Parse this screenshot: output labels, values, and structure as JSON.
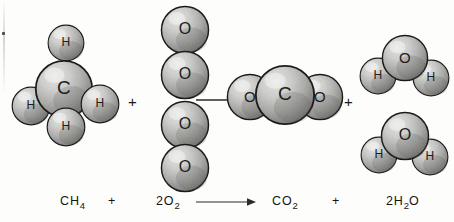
{
  "diagram": {
    "style": "hand-drawn pencil-shaded space-filling molecular models",
    "background_color": "#fdfdfc",
    "outline_color": "#1a1a1a",
    "sphere_light_color": "#e8e8e6",
    "sphere_mid_color": "#a9a9a6",
    "sphere_dark_color": "#5e5e5c",
    "label_color": "#1c1c1c",
    "reactant_operator": "+",
    "product_operator": "+"
  },
  "molecules": [
    {
      "id": "methane",
      "formula": "CH4",
      "name": "methane-molecule",
      "atoms": [
        {
          "element": "H",
          "label": "H",
          "x": 66,
          "y": 43,
          "r": 19,
          "z": 1
        },
        {
          "element": "H",
          "label": "H",
          "x": 31,
          "y": 106,
          "r": 20,
          "z": 1
        },
        {
          "element": "C",
          "label": "C",
          "x": 64,
          "y": 89,
          "r": 30,
          "z": 2
        },
        {
          "element": "H",
          "label": "H",
          "x": 100,
          "y": 104,
          "r": 20,
          "z": 3
        },
        {
          "element": "H",
          "label": "H",
          "x": 66,
          "y": 127,
          "r": 20,
          "z": 4
        }
      ]
    },
    {
      "id": "oxygen-top",
      "formula": "O2",
      "name": "oxygen-molecule-top",
      "atoms": [
        {
          "element": "O",
          "label": "O",
          "x": 185,
          "y": 30,
          "r": 25,
          "z": 1
        },
        {
          "element": "O",
          "label": "O",
          "x": 185,
          "y": 75,
          "r": 25,
          "z": 2
        }
      ]
    },
    {
      "id": "oxygen-bottom",
      "formula": "O2",
      "name": "oxygen-molecule-bottom",
      "atoms": [
        {
          "element": "O",
          "label": "O",
          "x": 185,
          "y": 125,
          "r": 25,
          "z": 1
        },
        {
          "element": "O",
          "label": "O",
          "x": 185,
          "y": 168,
          "r": 25,
          "z": 2
        }
      ]
    },
    {
      "id": "carbon-dioxide",
      "formula": "CO2",
      "name": "carbon-dioxide-molecule",
      "atoms": [
        {
          "element": "O",
          "label": "O",
          "x": 250,
          "y": 97,
          "r": 24,
          "z": 1
        },
        {
          "element": "O",
          "label": "O",
          "x": 320,
          "y": 97,
          "r": 24,
          "z": 1
        },
        {
          "element": "C",
          "label": "C",
          "x": 285,
          "y": 95,
          "r": 31,
          "z": 2
        }
      ]
    },
    {
      "id": "water-top",
      "formula": "H2O",
      "name": "water-molecule-top",
      "atoms": [
        {
          "element": "H",
          "label": "H",
          "x": 378,
          "y": 76,
          "r": 19,
          "z": 1
        },
        {
          "element": "H",
          "label": "H",
          "x": 431,
          "y": 78,
          "r": 19,
          "z": 1
        },
        {
          "element": "O",
          "label": "O",
          "x": 405,
          "y": 58,
          "r": 24,
          "z": 2
        }
      ]
    },
    {
      "id": "water-bottom",
      "formula": "H2O",
      "name": "water-molecule-bottom",
      "atoms": [
        {
          "element": "H",
          "label": "H",
          "x": 379,
          "y": 155,
          "r": 19,
          "z": 1
        },
        {
          "element": "H",
          "label": "H",
          "x": 430,
          "y": 157,
          "r": 19,
          "z": 1
        },
        {
          "element": "O",
          "label": "O",
          "x": 405,
          "y": 136,
          "r": 25,
          "z": 2
        }
      ]
    }
  ],
  "diagram_operators": [
    {
      "symbol": "+",
      "name": "diagram-plus-reactants",
      "x": 128,
      "y": 94
    },
    {
      "symbol": "+",
      "name": "diagram-plus-products",
      "x": 344,
      "y": 94
    }
  ],
  "diagram_arrow": {
    "name": "reaction-arrow-diagram",
    "x": 196,
    "y": 98,
    "length": 42
  },
  "equation": {
    "name": "chemical-equation",
    "full_text": "CH4 + 2O2 -> CO2 + 2H2O",
    "terms": [
      {
        "id": "reactant-methane",
        "coefficient": "",
        "symbol": "CH",
        "subscript": "4",
        "suffix": "",
        "x": 60
      },
      {
        "id": "equation-plus-left",
        "coefficient": "",
        "symbol": "+",
        "subscript": "",
        "suffix": "",
        "x": 108
      },
      {
        "id": "reactant-oxygen",
        "coefficient": "2",
        "symbol": "O",
        "subscript": "2",
        "suffix": "",
        "x": 156
      },
      {
        "id": "product-carbon-dioxide",
        "coefficient": "",
        "symbol": "CO",
        "subscript": "2",
        "suffix": "",
        "x": 272
      },
      {
        "id": "equation-plus-right",
        "coefficient": "",
        "symbol": "+",
        "subscript": "",
        "suffix": "",
        "x": 332
      },
      {
        "id": "product-water",
        "coefficient": "2",
        "symbol": "H",
        "subscript": "2",
        "suffix": "O",
        "x": 386
      }
    ],
    "arrow": {
      "name": "reaction-arrow-equation",
      "x": 196,
      "y": 200,
      "length": 60
    }
  }
}
